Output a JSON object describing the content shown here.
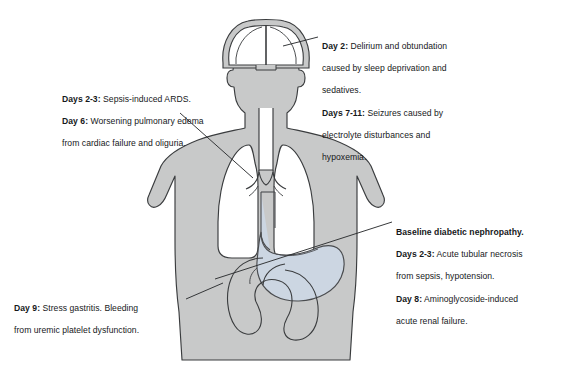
{
  "page": {
    "header_caption": "",
    "background_color": "#ffffff"
  },
  "figure": {
    "name": "multi-organ-system-complications-diagram",
    "body_fill": "#c8c9c9",
    "body_stroke": "#3a3c3e",
    "lung_fill": "#ffffff",
    "stomach_fill": "#ccd6e2",
    "stomach_stroke": "#4a4c4f",
    "brain_fill": "#c8c9c9",
    "leader_line_color": "#2c2e30",
    "organs": [
      {
        "name": "brain",
        "label": "brain-viewed-from-above"
      },
      {
        "name": "lungs",
        "label": "lungs-with-trachea-and-bronchi"
      },
      {
        "name": "stomach",
        "label": "stomach-and-esophagus"
      },
      {
        "name": "intestines",
        "label": "intestinal-loops"
      }
    ]
  },
  "annotations": {
    "ards": {
      "name": "pulmonary-annotation",
      "lines": [
        {
          "label": "Days 2-3:",
          "text": " Sepsis-induced ARDS."
        },
        {
          "label": "Day 6:",
          "text": " Worsening pulmonary edema"
        },
        {
          "label": "",
          "text": "from cardiac failure and oliguria."
        }
      ]
    },
    "neuro": {
      "name": "neurologic-annotation",
      "lines": [
        {
          "label": "Day 2:",
          "text": " Delirium and obtundation"
        },
        {
          "label": "",
          "text": "caused by sleep deprivation and"
        },
        {
          "label": "",
          "text": "sedatives."
        },
        {
          "label": "Days 7-11:",
          "text": " Seizures caused by"
        },
        {
          "label": "",
          "text": "electrolyte disturbances and"
        },
        {
          "label": "",
          "text": "hypoxemia."
        }
      ]
    },
    "renal": {
      "name": "renal-annotation",
      "lines": [
        {
          "label": "Baseline diabetic nephropathy.",
          "text": ""
        },
        {
          "label": "Days 2-3:",
          "text": " Acute tubular necrosis"
        },
        {
          "label": "",
          "text": "from sepsis, hypotension."
        },
        {
          "label": "Day 8:",
          "text": " Aminoglycoside-induced"
        },
        {
          "label": "",
          "text": "acute renal failure."
        }
      ]
    },
    "gi": {
      "name": "gastrointestinal-annotation",
      "lines": [
        {
          "label": "Day 9:",
          "text": " Stress gastritis. Bleeding"
        },
        {
          "label": "",
          "text": "from uremic platelet dysfunction."
        }
      ]
    }
  }
}
